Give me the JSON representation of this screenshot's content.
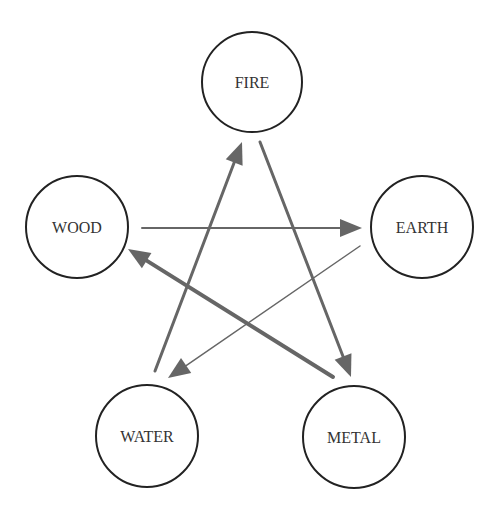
{
  "diagram": {
    "type": "five-elements-cycle",
    "colors": {
      "node_stroke": "#222222",
      "node_fill": "#ffffff",
      "label": "#333333",
      "arrow": "#666666"
    },
    "nodes": [
      {
        "id": "fire",
        "label": "FIRE",
        "cx": 252,
        "cy": 82,
        "r": 50
      },
      {
        "id": "wood",
        "label": "WOOD",
        "cx": 77,
        "cy": 227,
        "r": 51
      },
      {
        "id": "earth",
        "label": "EARTH",
        "cx": 422,
        "cy": 227,
        "r": 51
      },
      {
        "id": "water",
        "label": "WATER",
        "cx": 147,
        "cy": 436,
        "r": 51
      },
      {
        "id": "metal",
        "label": "METAL",
        "cx": 354,
        "cy": 437,
        "r": 51
      }
    ],
    "edges": [
      {
        "from": "wood",
        "to": "earth",
        "x1": 142,
        "y1": 228,
        "x2": 362,
        "y2": 228,
        "width": 2
      },
      {
        "from": "water",
        "to": "fire",
        "x1": 155,
        "y1": 371,
        "x2": 242,
        "y2": 142,
        "width": 3
      },
      {
        "from": "fire",
        "to": "metal",
        "x1": 260,
        "y1": 142,
        "x2": 351,
        "y2": 377,
        "width": 3
      },
      {
        "from": "earth",
        "to": "water",
        "x1": 360,
        "y1": 246,
        "x2": 168,
        "y2": 378,
        "width": 1.5
      },
      {
        "from": "metal",
        "to": "wood",
        "x1": 333,
        "y1": 377,
        "x2": 128,
        "y2": 249,
        "width": 4
      }
    ]
  }
}
